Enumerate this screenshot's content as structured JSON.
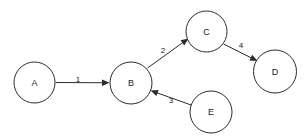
{
  "diagram": {
    "type": "directed-graph",
    "background_color": "#ffffff",
    "stroke_color": "#2b2b2b",
    "text_color": "#1a1a1a",
    "nodes": [
      {
        "id": "A",
        "label": "A",
        "cx": 34.5,
        "cy": 82.5,
        "r": 20.5
      },
      {
        "id": "B",
        "label": "B",
        "cx": 131.0,
        "cy": 83.0,
        "r": 21.0
      },
      {
        "id": "C",
        "label": "C",
        "cx": 206.5,
        "cy": 31.5,
        "r": 20.5
      },
      {
        "id": "D",
        "label": "D",
        "cx": 275.0,
        "cy": 71.5,
        "r": 21.5
      },
      {
        "id": "E",
        "label": "E",
        "cx": 211.0,
        "cy": 112.0,
        "r": 21.0
      }
    ],
    "edges": [
      {
        "label": "1",
        "from": "A",
        "to": "B",
        "x1": 55.5,
        "y1": 82.5,
        "x2": 109.5,
        "y2": 82.8,
        "label_x": 78,
        "label_y": 79
      },
      {
        "label": "2",
        "from": "B",
        "to": "C",
        "x1": 147.5,
        "y1": 68.0,
        "x2": 188.5,
        "y2": 38.5,
        "label_x": 163,
        "label_y": 50
      },
      {
        "label": "3",
        "from": "E",
        "to": "B",
        "x1": 192.5,
        "y1": 105.5,
        "x2": 150.5,
        "y2": 90.5,
        "label_x": 171,
        "label_y": 100
      },
      {
        "label": "4",
        "from": "C",
        "to": "D",
        "x1": 223.5,
        "y1": 44.0,
        "x2": 257.5,
        "y2": 61.0,
        "label_x": 241,
        "label_y": 45
      }
    ]
  }
}
